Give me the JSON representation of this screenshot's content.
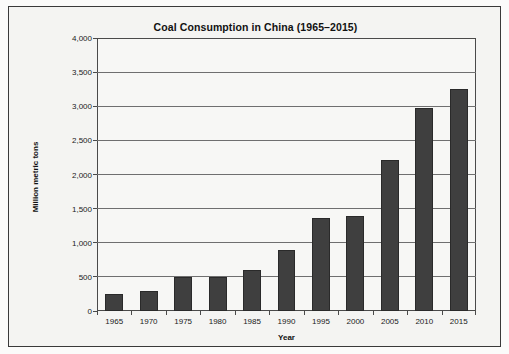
{
  "chart_data": {
    "type": "bar",
    "title": "Coal Consumption in China (1965–2015)",
    "xlabel": "Year",
    "ylabel": "Million metric tons",
    "categories": [
      "1965",
      "1970",
      "1975",
      "1980",
      "1985",
      "1990",
      "1995",
      "2000",
      "2005",
      "2010",
      "2015"
    ],
    "values": [
      250,
      295,
      500,
      500,
      600,
      900,
      1360,
      1390,
      2215,
      2970,
      3255
    ],
    "ylim": [
      0,
      4000
    ],
    "ytick_values": [
      0,
      500,
      1000,
      1500,
      2000,
      2500,
      3000,
      3500,
      4000
    ],
    "ytick_labels": [
      "0",
      "500",
      "1,000",
      "1,500",
      "2,000",
      "2,500",
      "3,000",
      "3,500",
      "4,000"
    ],
    "grid": true,
    "legend": false,
    "series": [
      {
        "name": "Coal consumption",
        "color": "#3f3f3f",
        "values": [
          250,
          295,
          500,
          500,
          600,
          900,
          1360,
          1390,
          2215,
          2970,
          3255
        ]
      }
    ]
  },
  "colors": {
    "bar_fill": "#3f3f3f",
    "bar_stroke": "#2a2a2a",
    "gridline": "#6f6f6f",
    "axis": "#4a4a4a",
    "frame_border": "#3a3a3a",
    "plot_background": "#f7f7f5",
    "page_background": "#f4f4f2",
    "text": "#111111"
  }
}
